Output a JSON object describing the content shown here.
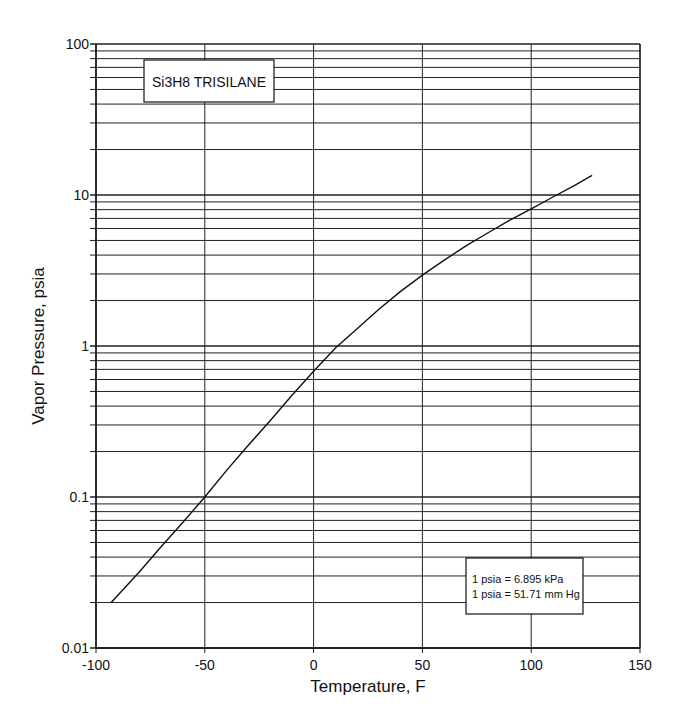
{
  "chart_data": {
    "type": "line",
    "title": "Si3H8  TRISILANE",
    "xlabel": "Temperature, F",
    "ylabel": "Vapor Pressure, psia",
    "xlim": [
      -100,
      150
    ],
    "ylim": [
      0.01,
      100
    ],
    "yscale": "log",
    "grid": true,
    "x_ticks": [
      -100,
      -50,
      0,
      50,
      100,
      150
    ],
    "x_tick_labels": [
      "-100",
      "-50",
      "0",
      "50",
      "100",
      "150"
    ],
    "y_ticks": [
      0.01,
      0.1,
      1,
      10,
      100
    ],
    "y_tick_labels": [
      "0.01",
      "0.1",
      "1",
      "10",
      "100"
    ],
    "annotation": [
      "1 psia = 6.895 kPa",
      "1 psia = 51.71 mm Hg"
    ],
    "series": [
      {
        "name": "Si3H8 Trisilane vapor pressure",
        "x": [
          -93,
          -80,
          -70,
          -60,
          -50,
          -40,
          -30,
          -20,
          -10,
          0,
          10,
          20,
          30,
          40,
          50,
          60,
          70,
          80,
          90,
          100,
          110,
          120,
          128
        ],
        "values": [
          0.02,
          0.032,
          0.047,
          0.068,
          0.1,
          0.15,
          0.22,
          0.32,
          0.47,
          0.68,
          0.97,
          1.3,
          1.75,
          2.3,
          2.95,
          3.7,
          4.6,
          5.6,
          6.8,
          8.1,
          9.7,
          11.6,
          13.5
        ]
      }
    ]
  },
  "colors": {
    "line": "#111111",
    "grid": "#222222",
    "background": "#ffffff"
  }
}
